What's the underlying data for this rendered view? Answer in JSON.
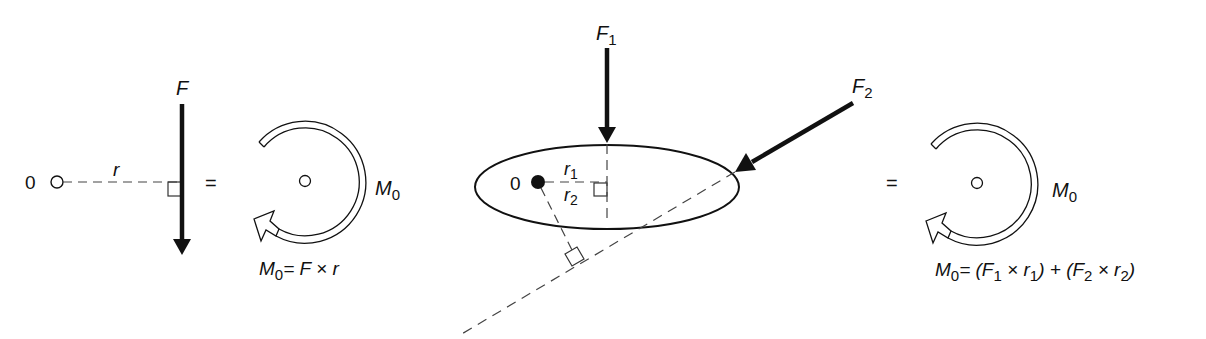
{
  "diagram": {
    "panels": [
      {
        "id": "single-force",
        "pivot_label": "0",
        "force_label": "F",
        "distance_label": "r",
        "equals": "=",
        "moment_label": "M",
        "moment_sub": "0",
        "formula": {
          "lhs": "M",
          "lhs_sub": "0",
          "rhs": "= F × r"
        }
      },
      {
        "id": "two-forces",
        "pivot_label": "0",
        "force1_label": "F",
        "force1_sub": "1",
        "force2_label": "F",
        "force2_sub": "2",
        "r1_label": "r",
        "r1_sub": "1",
        "r2_label": "r",
        "r2_sub": "2",
        "equals": "=",
        "moment_label": "M",
        "moment_sub": "0",
        "formula": {
          "lhs": "M",
          "lhs_sub": "0",
          "part1": "= (F",
          "part1_sub": "1",
          "part2": " ×  r",
          "part2_sub": "1",
          "part3": ") + (F",
          "part3_sub": "2",
          "part4": " × r",
          "part4_sub": "2",
          "part5": ")"
        }
      }
    ],
    "colors": {
      "ink": "#111111",
      "dash": "#555555",
      "background": "#ffffff"
    }
  }
}
